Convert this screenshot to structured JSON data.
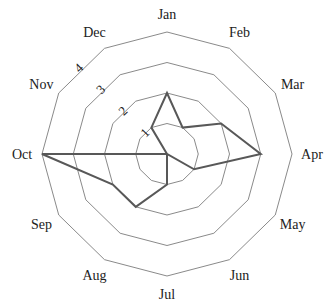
{
  "chart_data": {
    "type": "radar",
    "title": "",
    "categories": [
      "Jan",
      "Feb",
      "Mar",
      "Apr",
      "May",
      "Jun",
      "Jul",
      "Aug",
      "Sep",
      "Oct",
      "Nov",
      "Dec"
    ],
    "series": [
      {
        "name": "series-1",
        "values": [
          2,
          1,
          2,
          3,
          1,
          0,
          1,
          2,
          2,
          4,
          0,
          1
        ]
      }
    ],
    "radial_ticks": [
      "1",
      "2",
      "3",
      "4"
    ],
    "rlim": [
      0,
      4
    ],
    "grid": true,
    "grid_shape": "polygon",
    "legend": "none",
    "colors": {
      "line": "#585858",
      "grid": "#8a8a8a",
      "text": "#222222"
    }
  }
}
